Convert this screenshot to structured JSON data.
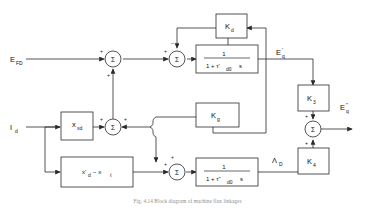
{
  "figure": {
    "caption": "Fig. 4.14  Block diagram of machine flux linkages",
    "type": "control-block-diagram"
  },
  "inputs": [
    {
      "name": "field-voltage-input",
      "label": "E",
      "sub": "FD"
    },
    {
      "name": "d-axis-current-input",
      "label": "I",
      "sub": "d"
    }
  ],
  "outputs": [
    {
      "name": "transient-emf-output",
      "label": "E",
      "prime": "'",
      "sub": "q"
    },
    {
      "name": "subtransient-emf-output",
      "label": "E",
      "prime": "\"",
      "sub": "q"
    }
  ],
  "signals": [
    {
      "name": "damper-flux-signal",
      "label": "Λ",
      "sub": "D"
    }
  ],
  "blocks": [
    {
      "name": "gain-kd-block",
      "label": "K",
      "sub": "d"
    },
    {
      "name": "gain-kg-block",
      "label": "K",
      "sub": "g"
    },
    {
      "name": "gain-k3-block",
      "label": "K",
      "sub": "3"
    },
    {
      "name": "gain-k4-block",
      "label": "K",
      "sub": "4"
    },
    {
      "name": "reactance-xad-block",
      "label": "x",
      "sub": "xd"
    },
    {
      "name": "reactance-difference-block",
      "label": "x'",
      "sub": "d",
      "label2": "− x",
      "sub2": "ℓ"
    },
    {
      "name": "lag-transient-block",
      "numerator": "1",
      "denominator": "1 + τ'",
      "den_sub": "d0",
      "den_tail": "s"
    },
    {
      "name": "lag-subtransient-block",
      "numerator": "1",
      "denominator": "1 + τ\"",
      "den_sub": "d0",
      "den_tail": "s"
    }
  ],
  "summing_junctions": [
    {
      "name": "sum-junction-1",
      "glyph": "Σ",
      "signs": [
        "+",
        "+"
      ]
    },
    {
      "name": "sum-junction-2",
      "glyph": "Σ",
      "signs": [
        "+",
        "−"
      ]
    },
    {
      "name": "sum-junction-3",
      "glyph": "Σ",
      "signs": [
        "+",
        "+"
      ]
    },
    {
      "name": "sum-junction-4",
      "glyph": "Σ",
      "signs": [
        "+",
        "+"
      ]
    },
    {
      "name": "sum-junction-5",
      "glyph": "Σ",
      "signs": [
        "+",
        "+"
      ]
    }
  ],
  "colors": {
    "line": "#2a2a2a",
    "text": "#111111",
    "caption": "#8d8d8d",
    "background": "#ffffff"
  }
}
